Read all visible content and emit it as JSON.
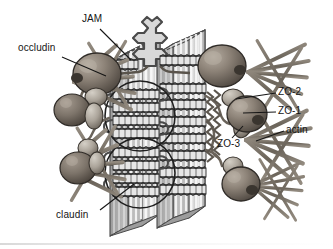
{
  "figure": {
    "kind": "biological-diagram",
    "background_color": "#ffffff",
    "ink_color": "#151515"
  },
  "labels": [
    {
      "id": "jam",
      "text": "JAM",
      "x": 82,
      "y": 14,
      "leader": {
        "x1": 100,
        "y1": 29,
        "x2": 131,
        "y2": 60
      }
    },
    {
      "id": "occludin",
      "text": "occludin",
      "x": 18,
      "y": 43,
      "leader": {
        "x1": 62,
        "y1": 57,
        "x2": 106,
        "y2": 76
      }
    },
    {
      "id": "zo2",
      "text": "ZO-2",
      "x": 278,
      "y": 87,
      "leader": {
        "x1": 276,
        "y1": 93,
        "x2": 236,
        "y2": 99
      }
    },
    {
      "id": "zo1",
      "text": "ZO-1",
      "x": 278,
      "y": 106,
      "leader": {
        "x1": 276,
        "y1": 112,
        "x2": 243,
        "y2": 113
      }
    },
    {
      "id": "actin",
      "text": "actin",
      "x": 286,
      "y": 125,
      "leader": {
        "x1": 284,
        "y1": 131,
        "x2": 256,
        "y2": 141
      }
    },
    {
      "id": "zo3",
      "text": "ZO-3",
      "x": 217,
      "y": 139,
      "leader": {
        "x1": 232,
        "y1": 138,
        "x2": 243,
        "y2": 126
      }
    },
    {
      "id": "claudin",
      "text": "claudin",
      "x": 56,
      "y": 210,
      "leader": {
        "x1": 100,
        "y1": 210,
        "x2": 134,
        "y2": 184
      }
    }
  ],
  "components": {
    "membranes": [
      {
        "id": "membrane-left",
        "role": "plasma membrane of cell A"
      },
      {
        "id": "membrane-right",
        "role": "plasma membrane of cell B"
      }
    ],
    "strand_circles": [
      {
        "id": "claudin-strand-circle-upper"
      },
      {
        "id": "claudin-strand-circle-lower"
      }
    ],
    "occludin_complexes": 2,
    "zo_complexes": 4,
    "actin_networks": 4,
    "claudin_strand_rows": 8
  },
  "colors": {
    "membrane_face": "#c9c9c9",
    "membrane_edge": "#9d9d9d",
    "membrane_stripe": "#f2f2f2",
    "membrane_top": "#b5b5b5",
    "protein_body": "#8c8176",
    "protein_light": "#c3bdb4",
    "protein_dark": "#5d554d",
    "actin": "#7a7268",
    "strand": "#6f6a64",
    "outline": "#2b2b2b"
  }
}
